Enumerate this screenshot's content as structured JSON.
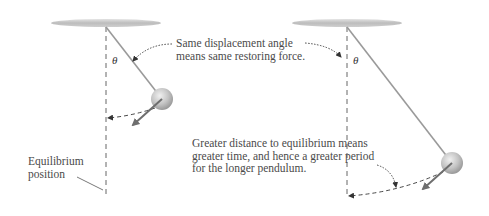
{
  "figure": {
    "left_pendulum": {
      "name": "short pendulum",
      "angle_symbol": "θ",
      "pivot": [
        106,
        27
      ],
      "bob": [
        162,
        99
      ],
      "bob_radius": 11,
      "arrow_tip": [
        132,
        126
      ],
      "arc_end": [
        107,
        118
      ]
    },
    "right_pendulum": {
      "name": "long pendulum",
      "angle_symbol": "θ",
      "pivot": [
        347,
        27
      ],
      "bob": [
        452,
        163
      ],
      "bob_radius": 11,
      "arrow_tip": [
        422,
        190
      ],
      "arc_end": [
        348,
        196
      ]
    },
    "annotations": {
      "same_angle": "Same displacement angle means same restoring force.",
      "same_angle_line1": "Same displacement angle",
      "same_angle_line2": "means same restoring force.",
      "greater_distance_line1": "Greater distance to equilibrium means",
      "greater_distance_line2": "greater time, and hence a greater period",
      "greater_distance_line3": "for the longer pendulum.",
      "equilibrium_line1": "Equilibrium",
      "equilibrium_line2": "position"
    },
    "colors": {
      "ceiling": "#b8b8b8",
      "rod": "#9a9a9a",
      "bob": "#c4c4c4",
      "arrow": "#6e6e6e",
      "dashed": "#555555",
      "text": "#4a4a4a"
    }
  }
}
